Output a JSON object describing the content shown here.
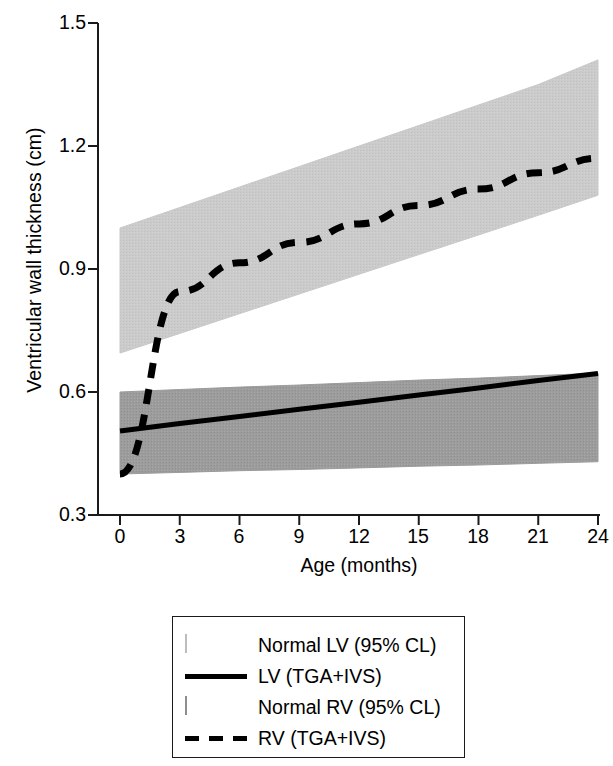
{
  "chart_data": {
    "type": "line",
    "title": "",
    "xlabel": "Age (months)",
    "ylabel": "Ventricular wall thickness (cm)",
    "xlim": [
      0,
      24
    ],
    "ylim": [
      0.3,
      1.5
    ],
    "xticks": [
      "0",
      "3",
      "6",
      "9",
      "12",
      "15",
      "18",
      "21",
      "24"
    ],
    "yticks": [
      "1.5",
      "1.2",
      "0.9",
      "0.6",
      "0.3"
    ],
    "grid": false,
    "legend_position": "below-axes",
    "x": [
      0,
      3,
      6,
      9,
      12,
      15,
      18,
      21,
      24
    ],
    "series": [
      {
        "name": "Normal LV (95% CL)",
        "type": "band",
        "color": "#c9c9c9",
        "upper": [
          1.0,
          1.05,
          1.1,
          1.15,
          1.2,
          1.25,
          1.3,
          1.35,
          1.41
        ],
        "lower": [
          0.695,
          0.743,
          0.791,
          0.839,
          0.887,
          0.935,
          0.983,
          1.031,
          1.08
        ]
      },
      {
        "name": "LV (TGA+IVS)",
        "type": "line",
        "style": "solid",
        "color": "#000000",
        "values": [
          0.505,
          0.523,
          0.54,
          0.558,
          0.575,
          0.593,
          0.61,
          0.628,
          0.645
        ]
      },
      {
        "name": "Normal RV (95% CL)",
        "type": "band",
        "color": "#9b9b9b",
        "upper": [
          0.6,
          0.606,
          0.612,
          0.617,
          0.623,
          0.629,
          0.634,
          0.64,
          0.646
        ],
        "lower": [
          0.4,
          0.404,
          0.408,
          0.411,
          0.415,
          0.419,
          0.422,
          0.426,
          0.43
        ]
      },
      {
        "name": "RV (TGA+IVS)",
        "type": "line",
        "style": "dashed",
        "color": "#000000",
        "values": [
          0.4,
          0.845,
          0.915,
          0.965,
          1.01,
          1.055,
          1.095,
          1.135,
          1.17
        ]
      }
    ]
  },
  "legend": {
    "items": [
      {
        "label": "Normal LV (95% CL)",
        "key": "band-light"
      },
      {
        "label": "LV (TGA+IVS)",
        "key": "line-solid"
      },
      {
        "label": "Normal RV (95% CL)",
        "key": "band-dark"
      },
      {
        "label": "RV (TGA+IVS)",
        "key": "line-dashed"
      }
    ]
  }
}
